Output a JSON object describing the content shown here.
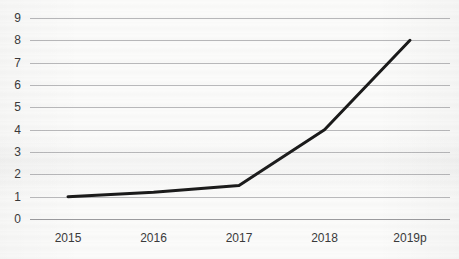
{
  "chart_data": {
    "type": "line",
    "title": "",
    "title_note": "clipped-above-top-edge",
    "xlabel": "",
    "ylabel": "",
    "categories": [
      "2015",
      "2016",
      "2017",
      "2018",
      "2019p"
    ],
    "values": [
      1.0,
      1.2,
      1.5,
      4.0,
      8.0
    ],
    "series": [
      {
        "name": "",
        "values": [
          1.0,
          1.2,
          1.5,
          4.0,
          8.0
        ]
      }
    ],
    "ylim": [
      0,
      9
    ],
    "yticks": [
      0,
      1,
      2,
      3,
      4,
      5,
      6,
      7,
      8,
      9
    ],
    "ytick_labels": [
      "0",
      "1",
      "2",
      "3",
      "4",
      "5",
      "6",
      "7",
      "8",
      "9"
    ],
    "grid": "horizontal",
    "legend": "none",
    "markers": "none",
    "annotations": [],
    "colors": {
      "line": "#1a1a1a",
      "gridline": "#b9b9bb",
      "baseline": "#9b9b9e",
      "background": "#fbfbfa",
      "tick_text": "#3a3a3a"
    },
    "style": {
      "line_width_px": 3,
      "appearance": "scanned-photocopy"
    }
  }
}
